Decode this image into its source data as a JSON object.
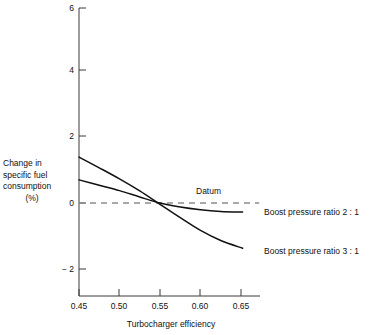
{
  "chart_data": {
    "type": "line",
    "title": "",
    "xlabel": "Turbocharger efficiency",
    "ylabel": "Change in specific fuel consumption (%)",
    "ylabel_lines": [
      "Change in",
      "specific fuel",
      "consumption",
      "(%)"
    ],
    "xlim": [
      0.45,
      0.6625
    ],
    "ylim": [
      -3.0,
      6.0
    ],
    "xticks": [
      0.45,
      0.5,
      0.55,
      0.6,
      0.65
    ],
    "xtick_labels": [
      "0.45",
      "0.50",
      "0.55",
      "0.60",
      "0.65"
    ],
    "yticks": [
      -2,
      0,
      2,
      4,
      6
    ],
    "ytick_labels": [
      "− 2",
      "0",
      "2",
      "4",
      "6"
    ],
    "grid": false,
    "legend_position": "inline-right",
    "annotations": [
      {
        "text": "Datum",
        "x": 0.588,
        "y": 0.35,
        "name": "datum-label"
      }
    ],
    "series": [
      {
        "name": "Boost pressure ratio 3 : 1",
        "label": "Boost pressure ratio 3 : 1",
        "style": "solid",
        "color": "#111111",
        "x": [
          0.45,
          0.475,
          0.5,
          0.525,
          0.55,
          0.575,
          0.6,
          0.625,
          0.652
        ],
        "y": [
          1.37,
          1.05,
          0.72,
          0.36,
          -0.04,
          -0.44,
          -0.82,
          -1.12,
          -1.35
        ]
      },
      {
        "name": "Boost pressure ratio 2 : 1",
        "label": "Boost pressure ratio 2 : 1",
        "style": "solid",
        "color": "#111111",
        "x": [
          0.45,
          0.475,
          0.5,
          0.525,
          0.55,
          0.575,
          0.6,
          0.625,
          0.652
        ],
        "y": [
          0.69,
          0.53,
          0.37,
          0.18,
          0.0,
          -0.12,
          -0.2,
          -0.25,
          -0.27
        ]
      },
      {
        "name": "Datum",
        "label": "Datum",
        "style": "dashed",
        "color": "#8c8c8c",
        "x": [
          0.45,
          0.6725
        ],
        "y": [
          0.0,
          0.0
        ]
      }
    ]
  },
  "labels": {
    "datum": "Datum",
    "series_2_1": "Boost pressure ratio 2 : 1",
    "series_3_1": "Boost pressure ratio 3 : 1",
    "xaxis_title": "Turbocharger efficiency",
    "y_line_1": "Change in",
    "y_line_2": "specific fuel",
    "y_line_3": "consumption",
    "y_line_4": "(%)",
    "ytick_6": "6",
    "ytick_4": "4",
    "ytick_2": "2",
    "ytick_0": "0",
    "ytick_m2": "− 2",
    "xtick_045": "0.45",
    "xtick_050": "0.50",
    "xtick_055": "0.55",
    "xtick_060": "0.60",
    "xtick_065": "0.65"
  },
  "colors": {
    "curve": "#111111",
    "datum": "#8c8c8c",
    "axis": "#3a3a3a",
    "text": "#111111",
    "background": "#ffffff"
  }
}
